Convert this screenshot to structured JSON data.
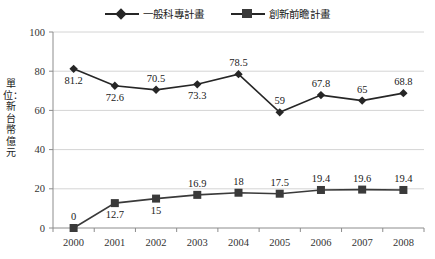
{
  "legend": {
    "position": "top-center",
    "entries": [
      {
        "label": "一般科專計畫",
        "marker": "diamond-marker-icon"
      },
      {
        "label": "創新前瞻計畫",
        "marker": "square-marker-icon"
      }
    ]
  },
  "axis": {
    "y_title": "單位：新台幣億元",
    "y_ticks": [
      "0",
      "20",
      "40",
      "60",
      "80",
      "100"
    ],
    "x_ticks": [
      "2000",
      "2001",
      "2002",
      "2003",
      "2004",
      "2005",
      "2006",
      "2007",
      "2008"
    ]
  },
  "colors": {
    "series_1": "#262626",
    "series_2": "#3a3a3a",
    "grid": "#d4d4d4",
    "axis": "#8c8c8c",
    "background": "#ffffff",
    "text": "#1a1a1a"
  },
  "chart_data": {
    "type": "line",
    "title": "",
    "subtitle": "",
    "xlabel": "",
    "ylabel": "單位：新台幣億元",
    "x": [
      "2000",
      "2001",
      "2002",
      "2003",
      "2004",
      "2005",
      "2006",
      "2007",
      "2008"
    ],
    "categories": [
      "2000",
      "2001",
      "2002",
      "2003",
      "2004",
      "2005",
      "2006",
      "2007",
      "2008"
    ],
    "ylim": [
      0,
      100
    ],
    "yticks": [
      0,
      20,
      40,
      60,
      80,
      100
    ],
    "grid": true,
    "legend_position": "top-center",
    "series": [
      {
        "name": "一般科專計畫",
        "marker": "diamond",
        "color": "#262626",
        "values": [
          81.2,
          72.6,
          70.5,
          73.3,
          78.5,
          59,
          67.8,
          65,
          68.8
        ],
        "labels": [
          "81.2",
          "72.6",
          "70.5",
          "73.3",
          "78.5",
          "59",
          "67.8",
          "65",
          "68.8"
        ],
        "label_positions": [
          "below",
          "below",
          "above",
          "below",
          "above",
          "above",
          "above",
          "above",
          "above"
        ]
      },
      {
        "name": "創新前瞻計畫",
        "marker": "square",
        "color": "#3a3a3a",
        "values": [
          0,
          12.7,
          15,
          16.9,
          18,
          17.5,
          19.4,
          19.6,
          19.4
        ],
        "labels": [
          "0",
          "12.7",
          "15",
          "16.9",
          "18",
          "17.5",
          "19.4",
          "19.6",
          "19.4"
        ],
        "label_positions": [
          "above",
          "below",
          "below",
          "above",
          "above",
          "above",
          "above",
          "above",
          "above"
        ]
      }
    ]
  }
}
